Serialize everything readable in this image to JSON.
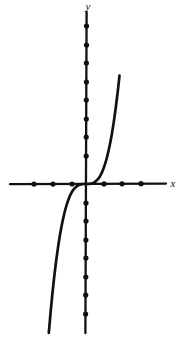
{
  "figure": {
    "background_color": "#ffffff",
    "ink_color": "#111111",
    "width": 188,
    "height": 339
  },
  "axes": {
    "x_label": "x",
    "y_label": "y",
    "x_axis_y_pixel": 184,
    "y_axis_x_pixel": 86,
    "x_axis_start_pixel": 10,
    "x_axis_end_pixel": 166,
    "y_axis_start_pixel": 12,
    "y_axis_end_pixel": 333,
    "unit_pixels": 18.6,
    "axis_stroke_width": 2.2,
    "origin_marked": false
  },
  "chart_data": {
    "type": "line",
    "xlabel": "x",
    "ylabel": "y",
    "xlim": [
      -4,
      4.3
    ],
    "ylim": [
      -8,
      8.5
    ],
    "grid": false,
    "legend": null,
    "x_tick_values": [
      -3,
      -2,
      -1,
      0,
      1,
      2,
      3
    ],
    "y_tick_values": [
      -7,
      -6,
      -5,
      -4,
      -3,
      -2,
      -1,
      0,
      1,
      2,
      3,
      4,
      5,
      6,
      7,
      8
    ],
    "tick_style": "filled-dot",
    "tick_labels_shown": false,
    "series": [
      {
        "name": "y = x³",
        "x": [
          -2.0,
          -1.9,
          -1.8,
          -1.7,
          -1.6,
          -1.5,
          -1.4,
          -1.3,
          -1.2,
          -1.1,
          -1.0,
          -0.9,
          -0.8,
          -0.7,
          -0.6,
          -0.5,
          -0.4,
          -0.3,
          -0.2,
          -0.1,
          0.0,
          0.1,
          0.2,
          0.3,
          0.4,
          0.5,
          0.6,
          0.7,
          0.8,
          0.9,
          1.0,
          1.1,
          1.2,
          1.3,
          1.4,
          1.5,
          1.6,
          1.7,
          1.8
        ],
        "y": [
          -8.0,
          -6.86,
          -5.83,
          -4.91,
          -4.1,
          -3.38,
          -2.74,
          -2.2,
          -1.73,
          -1.33,
          -1.0,
          -0.73,
          -0.51,
          -0.34,
          -0.22,
          -0.13,
          -0.06,
          -0.03,
          -0.01,
          0.0,
          0.0,
          0.0,
          0.01,
          0.03,
          0.06,
          0.13,
          0.22,
          0.34,
          0.51,
          0.73,
          1.0,
          1.33,
          1.73,
          2.2,
          2.74,
          3.38,
          4.1,
          4.91,
          5.83
        ]
      }
    ],
    "x_intercepts": [
      0
    ],
    "y_intercepts": [
      0
    ],
    "inflection_point": [
      0,
      0
    ],
    "curve_stroke_width": 2.6,
    "annotations": []
  },
  "dots": {
    "x_axis_negative_pixels": [
      34,
      53,
      72
    ],
    "x_axis_positive_pixels": [
      104,
      122,
      141
    ],
    "y_axis_above_pixels": [
      26,
      45,
      63,
      82,
      100,
      119,
      137,
      156
    ],
    "y_axis_below_pixels": [
      203,
      221,
      240,
      258,
      277,
      295,
      314
    ],
    "dot_radius": 2.6,
    "dot_color": "#111111"
  }
}
